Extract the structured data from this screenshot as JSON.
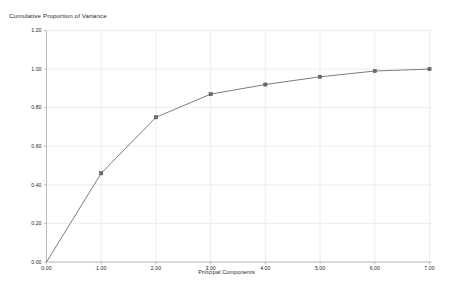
{
  "chart_data": {
    "type": "line",
    "title": "Cumulative Proportion of Variance",
    "xlabel": "Principal Components",
    "ylabel": "",
    "x": [
      0,
      1,
      2,
      3,
      4,
      5,
      6,
      7
    ],
    "values": [
      0.0,
      0.46,
      0.75,
      0.87,
      0.92,
      0.96,
      0.99,
      1.0
    ],
    "categories": [
      "0.00",
      "1.00",
      "2.00",
      "3.00",
      "4.00",
      "5.00",
      "6.00",
      "7.00"
    ],
    "xlim": [
      0,
      7
    ],
    "ylim": [
      0,
      1.2
    ],
    "xticks": [
      "0.00",
      "1.00",
      "2.00",
      "3.00",
      "4.00",
      "5.00",
      "6.00",
      "7.00"
    ],
    "yticks": [
      "0.00",
      "0.20",
      "0.40",
      "0.60",
      "0.80",
      "1.00",
      "1.20"
    ],
    "ytick_values": [
      0.0,
      0.2,
      0.4,
      0.6,
      0.8,
      1.0,
      1.2
    ],
    "grid": true,
    "legend": "none",
    "marker": "square",
    "line_color": "#7d7d7d",
    "marker_color": "#6b6b6b",
    "grid_color": "#e9e9e9",
    "axis_color": "#b8b8b8",
    "background": "#ffffff"
  }
}
